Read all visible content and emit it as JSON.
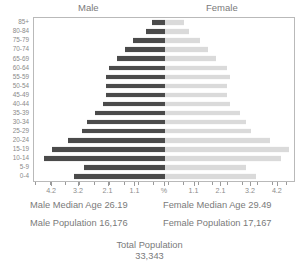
{
  "header": {
    "male_label": "Male",
    "female_label": "Female"
  },
  "stats": {
    "male_median_age": "Male Median Age 26.19",
    "female_median_age": "Female Median Age 29.49",
    "male_population": "Male Population 16,176",
    "female_population": "Female Population 17,167",
    "total_population_label": "Total Population",
    "total_population_value": "33,343"
  },
  "colors": {
    "male_bar": "#4b4b4b",
    "female_bar": "#dadada",
    "frame": "#b9b9b9",
    "text": "#7a7a7a"
  },
  "chart_data": {
    "type": "bar",
    "title": "",
    "subtype": "population-pyramid",
    "xlabel": "%",
    "ylabel": "",
    "grid": false,
    "legend": [
      "Male",
      "Female"
    ],
    "legend_position": "top",
    "axis_center_label": "%",
    "xlim": [
      -4.8,
      4.8
    ],
    "tick_values": [
      -4.2,
      -3.2,
      -2.1,
      -1.1,
      0,
      1.1,
      2.1,
      3.2,
      4.2
    ],
    "tick_labels": [
      "4.2",
      "3.2",
      "2.1",
      "1.1",
      "%",
      "1.1",
      "2.1",
      "3.2",
      "4.2"
    ],
    "categories": [
      "0-4",
      "5-9",
      "10-14",
      "15-19",
      "20-24",
      "25-29",
      "30-34",
      "35-39",
      "40-44",
      "45-49",
      "50-54",
      "55-59",
      "60-64",
      "65-69",
      "70-74",
      "75-79",
      "80-84",
      "85+"
    ],
    "series": [
      {
        "name": "Male",
        "values": [
          3.4,
          3.0,
          4.5,
          4.2,
          3.6,
          3.1,
          2.9,
          2.6,
          2.3,
          2.2,
          2.2,
          2.2,
          2.1,
          1.8,
          1.5,
          1.2,
          0.7,
          0.5
        ]
      },
      {
        "name": "Female",
        "values": [
          3.4,
          3.0,
          4.3,
          4.6,
          3.9,
          3.2,
          3.0,
          2.8,
          2.4,
          2.3,
          2.3,
          2.4,
          2.3,
          1.9,
          1.6,
          1.3,
          0.9,
          0.7
        ]
      }
    ]
  }
}
